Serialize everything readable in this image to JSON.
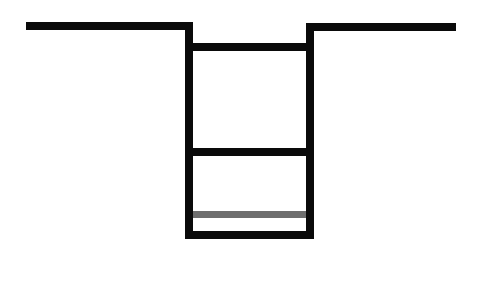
{
  "diagram": {
    "type": "trench-cross-section",
    "colors": {
      "background": "#ffffff",
      "line": "#0a0a0a",
      "accent_line": "#6e6e6e"
    },
    "segments": [
      {
        "name": "ground-line-left",
        "x": 26,
        "y": 22,
        "w": 167,
        "h": 8,
        "color": "line"
      },
      {
        "name": "ground-line-right",
        "x": 306,
        "y": 23,
        "w": 150,
        "h": 8,
        "color": "line"
      },
      {
        "name": "trench-wall-left",
        "x": 185,
        "y": 22,
        "w": 8,
        "h": 217,
        "color": "line"
      },
      {
        "name": "trench-wall-right",
        "x": 306,
        "y": 23,
        "w": 8,
        "h": 216,
        "color": "line"
      },
      {
        "name": "upper-rung",
        "x": 185,
        "y": 43,
        "w": 129,
        "h": 8,
        "color": "line"
      },
      {
        "name": "middle-rung",
        "x": 185,
        "y": 148,
        "w": 129,
        "h": 8,
        "color": "line"
      },
      {
        "name": "gray-layer-line",
        "x": 193,
        "y": 211,
        "w": 113,
        "h": 7,
        "color": "accent_line"
      },
      {
        "name": "trench-bottom",
        "x": 185,
        "y": 231,
        "w": 129,
        "h": 8,
        "color": "line"
      }
    ]
  }
}
